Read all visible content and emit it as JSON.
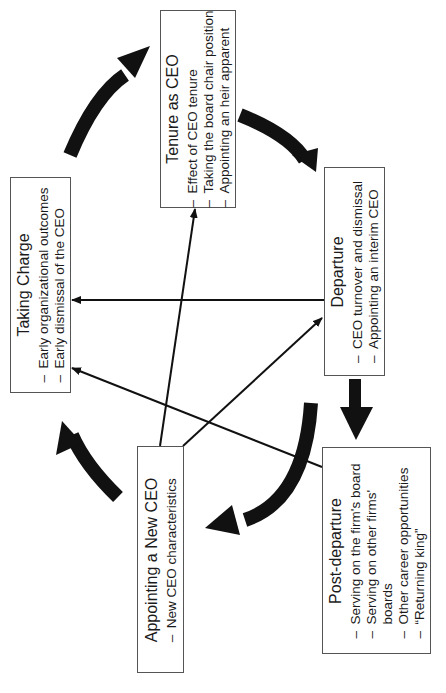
{
  "stages": {
    "taking_charge": {
      "title": "Taking Charge",
      "items": [
        "Early organizational outcomes",
        "Early dismissal of the CEO"
      ]
    },
    "tenure": {
      "title": "Tenure as CEO",
      "items": [
        "Effect of CEO tenure",
        "Taking the board chair position",
        "Appointing an heir apparent"
      ]
    },
    "departure": {
      "title": "Departure",
      "items": [
        "CEO turnover and dismissal",
        "Appointing an interim CEO"
      ]
    },
    "post_departure": {
      "title": "Post-departure",
      "items": [
        "Serving on the firm's board",
        "Serving on other firms'",
        "boards",
        "Other career opportunities",
        "“Returning king”"
      ]
    },
    "appointing": {
      "title": "Appointing a New CEO",
      "items": [
        "New CEO characteristics"
      ]
    }
  },
  "bullet": "–",
  "colors": {
    "arrow": "#111111",
    "border": "#555555",
    "text": "#1a1a1a"
  }
}
